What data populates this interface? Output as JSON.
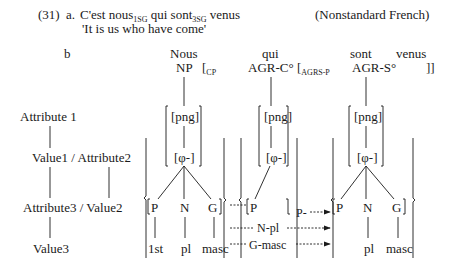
{
  "example": {
    "number": "(31)",
    "a": {
      "label": "a.",
      "sentence_parts": [
        "C'est nous",
        "1SG",
        "qui sont",
        "3SG",
        "venus"
      ],
      "language": "(Nonstandard French)",
      "gloss": "'It is us who have come'"
    },
    "b": {
      "label": "b"
    }
  },
  "tree": {
    "words": {
      "nous": "Nous",
      "qui": "qui",
      "sont": "sont",
      "venus": "venus"
    },
    "heads": {
      "np": "NP",
      "agrc": "AGR-C°",
      "agrs": "AGR-S°"
    },
    "brackets": {
      "cp_open": "[",
      "cp_sub": "CP",
      "agrsp_open": "[",
      "agrsp_sub": "AGRS-P",
      "close": "]]"
    },
    "png": "[png]",
    "phi": "[φ-]",
    "features": {
      "p": "P",
      "n": "N",
      "g": "G"
    },
    "values": {
      "first": "1st",
      "pl": "pl",
      "masc": "masc"
    },
    "arrows": {
      "p": "P-",
      "n": "N-pl",
      "g": "G-masc"
    }
  },
  "legend": {
    "attribute1": "Attribute 1",
    "value1_attribute2": "Value1 / Attribute2",
    "attribute3_value2": "Attribute3 / Value2",
    "value3": "Value3"
  }
}
